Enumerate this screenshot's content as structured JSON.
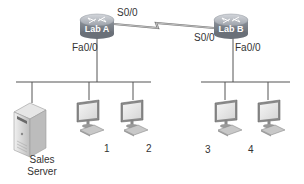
{
  "diagram": {
    "type": "network-topology",
    "routers": [
      {
        "id": "lab-a",
        "label": "Lab A",
        "serial_interface": "S0/0",
        "lan_interface": "Fa0/0"
      },
      {
        "id": "lab-b",
        "label": "Lab B",
        "serial_interface": "S0/0",
        "lan_interface": "Fa0/0"
      }
    ],
    "wan_link": {
      "type": "serial",
      "from": "Lab A S0/0",
      "to": "Lab B S0/0"
    },
    "lans": [
      {
        "router": "Lab A",
        "hosts": [
          {
            "type": "server",
            "label_line1": "Sales",
            "label_line2": "Server"
          },
          {
            "type": "workstation",
            "label": "1"
          },
          {
            "type": "workstation",
            "label": "2"
          }
        ]
      },
      {
        "router": "Lab B",
        "hosts": [
          {
            "type": "workstation",
            "label": "3"
          },
          {
            "type": "workstation",
            "label": "4"
          }
        ]
      }
    ],
    "colors": {
      "line": "#555555",
      "router_top": "#b8bcc4",
      "router_body": "#7d838c",
      "monitor_frame": "#8a8a8a",
      "monitor_screen": "#e4e4e4",
      "server_body": "#d9d9d9",
      "text": "#333333"
    }
  }
}
